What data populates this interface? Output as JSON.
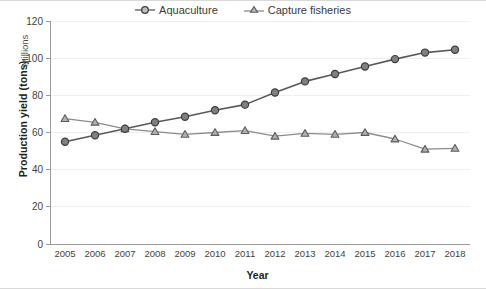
{
  "chart_data": {
    "type": "line",
    "title": "",
    "xlabel": "Year",
    "ylabel": "Production yield (tons)",
    "y_units": "Millions",
    "x": [
      2005,
      2006,
      2007,
      2008,
      2009,
      2010,
      2011,
      2012,
      2013,
      2014,
      2015,
      2016,
      2017,
      2018
    ],
    "categories": [
      "2005",
      "2006",
      "2007",
      "2008",
      "2009",
      "2010",
      "2011",
      "2012",
      "2013",
      "2014",
      "2015",
      "2016",
      "2017",
      "2018"
    ],
    "xlim": [
      2005,
      2018
    ],
    "ylim": [
      0,
      120
    ],
    "y_ticks": [
      0,
      20,
      40,
      60,
      80,
      100,
      120
    ],
    "grid": true,
    "legend_position": "top-center",
    "series": [
      {
        "name": "Aquaculture",
        "marker": "circle",
        "color": "#595959",
        "values": [
          55.0,
          58.5,
          62.0,
          65.5,
          68.5,
          72.0,
          75.0,
          81.5,
          87.5,
          91.5,
          95.5,
          99.5,
          103.0,
          104.5
        ]
      },
      {
        "name": "Capture fisheries",
        "marker": "triangle",
        "color": "#8c8c8c",
        "values": [
          67.5,
          65.5,
          62.0,
          60.5,
          59.0,
          60.0,
          61.0,
          58.0,
          59.5,
          59.0,
          60.0,
          56.5,
          51.0,
          51.5
        ]
      }
    ]
  },
  "legend": {
    "items": [
      {
        "label": "Aquaculture",
        "marker": "circle-marker-icon"
      },
      {
        "label": "Capture fisheries",
        "marker": "triangle-marker-icon"
      }
    ]
  },
  "axes": {
    "y_title": "Production yield (tons)",
    "y_units": "Millions",
    "x_title": "Year"
  },
  "colors": {
    "aquaculture": "#595959",
    "capture_fisheries": "#8c8c8c",
    "axis": "#9a9a9a",
    "grid": "#efefef",
    "text": "#231f20",
    "background": "#ffffff"
  }
}
